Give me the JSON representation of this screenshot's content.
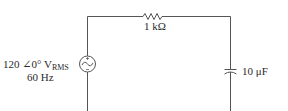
{
  "circuit": {
    "source": {
      "magnitude": "120",
      "angle_symbol": "∠",
      "angle": "0°",
      "unit": "V",
      "unit_subscript": "RMS",
      "frequency": "60 Hz"
    },
    "resistor": {
      "label": "1 kΩ"
    },
    "capacitor": {
      "label": "10 μF"
    },
    "colors": {
      "wire": "#555555",
      "text": "#2a2a2a",
      "background": "#ffffff"
    }
  }
}
